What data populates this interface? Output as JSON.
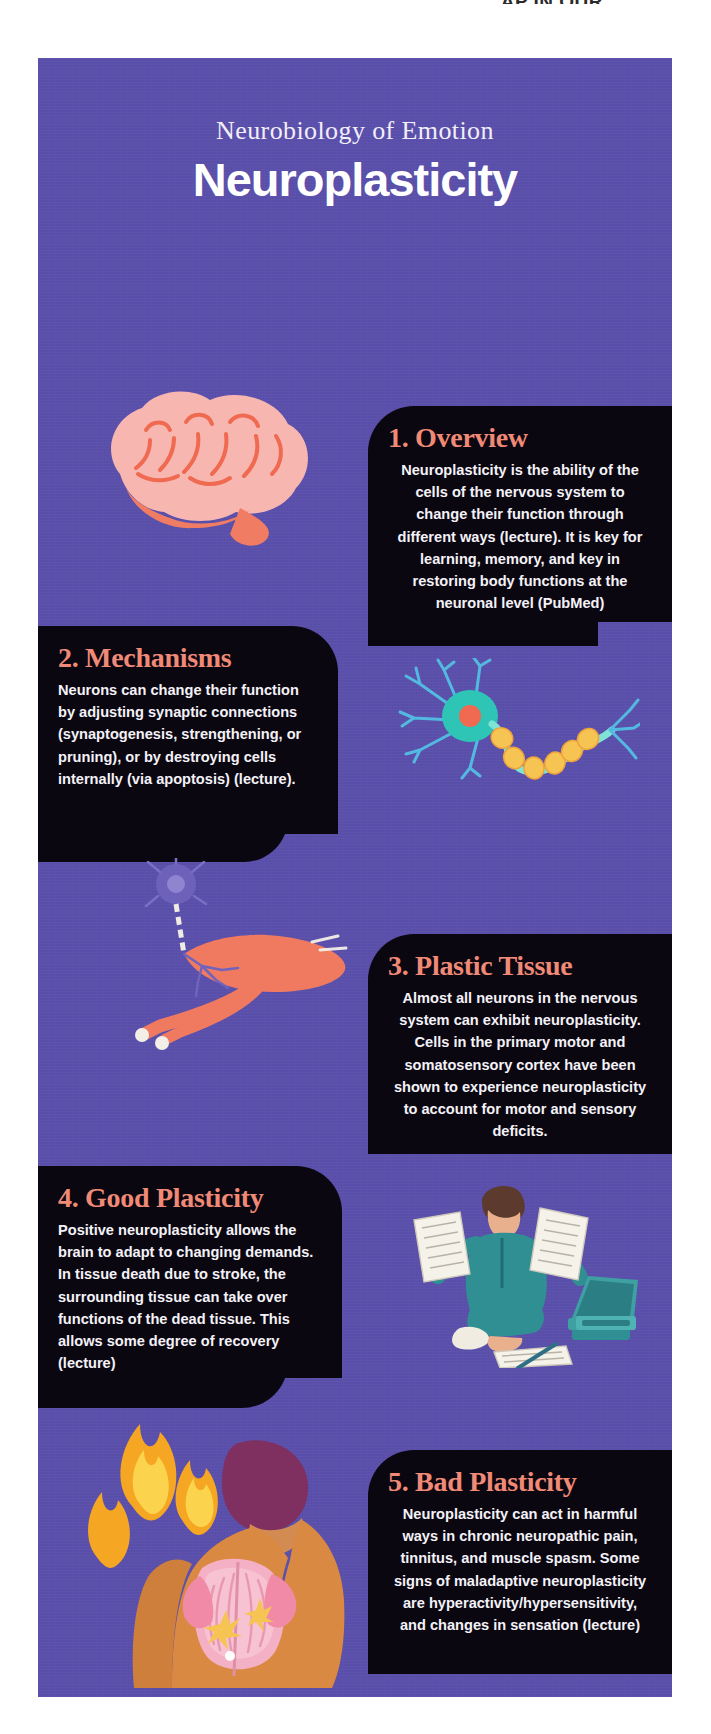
{
  "page": {
    "top_cut_text": "AP IN OUR",
    "background_color": "#5a4fab",
    "card_color": "#0b0711",
    "heading_color": "#f08a76",
    "body_text_color": "#f4f2f8"
  },
  "header": {
    "kicker": "Neurobiology of Emotion",
    "title": "Neuroplasticity"
  },
  "sections": [
    {
      "id": "overview",
      "heading": "1. Overview",
      "body": "Neuroplasticity is the ability of the cells of the nervous system to change their function through different ways (lecture). It is key for learning, memory, and key in restoring body functions at the neuronal level (PubMed)",
      "align": "center",
      "illustration": "brain-illustration"
    },
    {
      "id": "mechanisms",
      "heading": "2. Mechanisms",
      "body": "Neurons can change their function by adjusting synaptic connections (synaptogenesis, strengthening, or pruning), or by destroying cells internally (via apoptosis) (lecture).",
      "align": "left",
      "illustration": "neuron-illustration"
    },
    {
      "id": "plastic-tissue",
      "heading": "3. Plastic Tissue",
      "body": "Almost all  neurons in the nervous system can exhibit neuroplasticity. Cells in the primary motor and somatosensory cortex have been shown to experience neuroplasticity to account for motor and sensory deficits.",
      "align": "center",
      "illustration": "muscle-illustration"
    },
    {
      "id": "good-plasticity",
      "heading": "4. Good Plasticity",
      "body": "Positive neuroplasticity allows the brain to adapt to changing demands. In tissue death due to stroke, the surrounding tissue can take over functions of the dead tissue. This allows some degree of recovery (lecture)",
      "align": "left",
      "illustration": "student-illustration"
    },
    {
      "id": "bad-plasticity",
      "heading": "5. Bad Plasticity",
      "body": "Neuroplasticity can act in harmful ways in chronic neuropathic pain, tinnitus, and muscle spasm. Some signs of maladaptive neuroplasticity are hyperactivity/hypersensitivity, and changes in sensation (lecture)",
      "align": "center",
      "illustration": "back-pain-illustration"
    }
  ]
}
